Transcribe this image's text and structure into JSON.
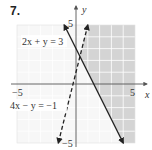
{
  "problem": {
    "number": "7."
  },
  "graph": {
    "x_axis_label": "x",
    "y_axis_label": "y",
    "ticks": {
      "x_min": "−5",
      "x_max": "5",
      "y_max": "5",
      "y_min": "−5"
    },
    "lines": [
      {
        "equation": "2x + y = 3",
        "style": "solid"
      },
      {
        "equation": "4x − y = −1",
        "style": "dashed"
      }
    ],
    "shaded_region": "right of 4x − y = −1 and right of 2x + y = 3",
    "colors": {
      "grid": "#e6e6e6",
      "shade": "#d4d4d4",
      "axis": "#555555",
      "lines": "#222222"
    }
  }
}
